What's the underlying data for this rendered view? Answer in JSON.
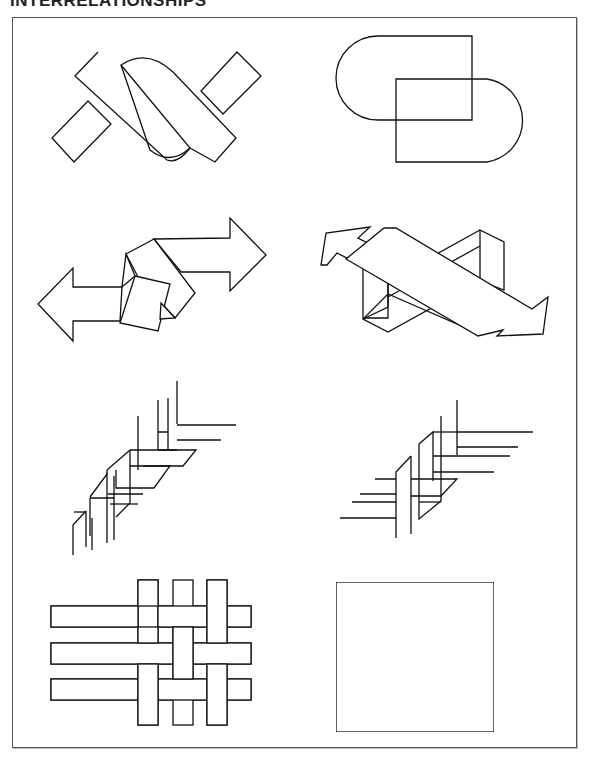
{
  "page": {
    "title": "INTERRELATIONSHIPS",
    "frame_color": "#555555",
    "line_color": "#111111",
    "background": "#ffffff"
  },
  "figures": [
    {
      "id": 1,
      "row": 1,
      "col": 1,
      "description": "Two diagonal bars crossed by two short rectangles and a rounded lens band"
    },
    {
      "id": 2,
      "row": 1,
      "col": 2,
      "description": "Two overlapping stadium (rounded rectangle) outlines"
    },
    {
      "id": 3,
      "row": 2,
      "col": 1,
      "description": "Two opposite-pointing arrows knotted by twisted bands"
    },
    {
      "id": 4,
      "row": 2,
      "col": 2,
      "description": "Two crossing 3D arrows with impossible box structure"
    },
    {
      "id": 5,
      "row": 3,
      "col": 1,
      "description": "Stair-step braided vertical strips with ends"
    },
    {
      "id": 6,
      "row": 3,
      "col": 2,
      "description": "Stair-step braided strips with horizontal ends extending both sides"
    },
    {
      "id": 7,
      "row": 4,
      "col": 1,
      "description": "Basket weave of three horizontal and three vertical strips"
    },
    {
      "id": 8,
      "row": 4,
      "col": 2,
      "description": "Diagonal herringbone basket weave pattern"
    }
  ]
}
